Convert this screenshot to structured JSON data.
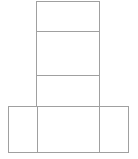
{
  "diagram": {
    "type": "cuboid-net",
    "stroke_color": "#a0a0a0",
    "background": "#ffffff",
    "faces": [
      {
        "id": "top-1",
        "x": 36,
        "y": 1,
        "w": 64,
        "h": 31
      },
      {
        "id": "top-2",
        "x": 36,
        "y": 31,
        "w": 64,
        "h": 45
      },
      {
        "id": "top-3",
        "x": 36,
        "y": 75,
        "w": 64,
        "h": 32
      },
      {
        "id": "bottom-left",
        "x": 8,
        "y": 106,
        "w": 30,
        "h": 47
      },
      {
        "id": "bottom-center",
        "x": 37,
        "y": 106,
        "w": 63,
        "h": 47
      },
      {
        "id": "bottom-right",
        "x": 99,
        "y": 106,
        "w": 30,
        "h": 47
      }
    ]
  }
}
